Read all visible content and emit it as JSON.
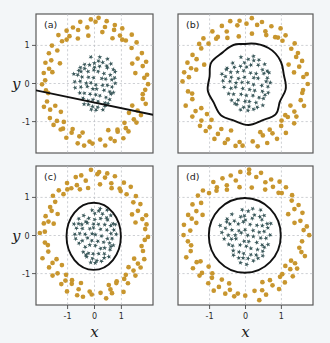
{
  "figure": {
    "background_color": "#f3f6f8",
    "panel_background": "#ffffff",
    "frame_color": "#5a5a5a",
    "grid_color": "#b9bcc2",
    "boundary_color": "#111111"
  },
  "axes": {
    "x_label": "x",
    "y_label": "y",
    "x_ticks": [
      "-1",
      "0",
      "1"
    ],
    "y_ticks": [
      "1",
      "0",
      "-1"
    ],
    "x_tick_values": [
      -1,
      0,
      1
    ],
    "y_tick_values": [
      1,
      0,
      -1
    ],
    "xlim": [
      -1.85,
      1.85
    ],
    "ylim": [
      -1.85,
      1.85
    ]
  },
  "chart_data": {
    "type": "scatter",
    "title": "",
    "subtitle": "",
    "xlabel": "x",
    "ylabel": "y",
    "xlim": [
      -1.85,
      1.85
    ],
    "ylim": [
      -1.85,
      1.85
    ],
    "grid": true,
    "legend_position": "none",
    "annotations": [
      "(a)",
      "(b)",
      "(c)",
      "(d)"
    ],
    "classes": [
      {
        "name": "inner-class",
        "marker": "star",
        "color": "#3c5a5c",
        "description": "Dense cluster of star markers near the origin, radius approximately 0 to 0.8"
      },
      {
        "name": "outer-class",
        "marker": "circle",
        "color": "#c8962e",
        "description": "Ring of circular markers at radius approximately 1.2 to 1.8 around the origin"
      }
    ],
    "panels": [
      {
        "tag": "(a)",
        "boundary_type": "line",
        "boundary_description": "Straight line decision boundary sloping down to the right",
        "boundary_points": [
          [
            -1.85,
            -0.18
          ],
          [
            1.85,
            -0.82
          ]
        ]
      },
      {
        "tag": "(b)",
        "boundary_type": "closed-wiggly-curve",
        "boundary_description": "Irregular wiggly closed curve tightly wrapping the inner star cluster",
        "boundary_radius_mean": 0.95
      },
      {
        "tag": "(c)",
        "boundary_type": "circle",
        "boundary_description": "Smooth circular decision boundary centred near the origin",
        "boundary_center": [
          -0.03,
          -0.02
        ],
        "boundary_radius": 0.88
      },
      {
        "tag": "(d)",
        "boundary_type": "circle",
        "boundary_description": "Smooth circular decision boundary centred near the origin, slightly larger",
        "boundary_center": [
          -0.02,
          -0.03
        ],
        "boundary_radius": 0.97
      }
    ],
    "inner_points": [
      [
        -0.02,
        0.55
      ],
      [
        0.1,
        0.62
      ],
      [
        0.26,
        0.58
      ],
      [
        0.38,
        0.5
      ],
      [
        -0.15,
        0.48
      ],
      [
        0.02,
        0.44
      ],
      [
        0.18,
        0.46
      ],
      [
        0.44,
        0.4
      ],
      [
        0.58,
        0.34
      ],
      [
        -0.3,
        0.4
      ],
      [
        -0.42,
        0.32
      ],
      [
        -0.22,
        0.3
      ],
      [
        -0.05,
        0.34
      ],
      [
        0.12,
        0.3
      ],
      [
        0.3,
        0.28
      ],
      [
        0.48,
        0.24
      ],
      [
        0.62,
        0.18
      ],
      [
        -0.55,
        0.2
      ],
      [
        -0.38,
        0.18
      ],
      [
        -0.18,
        0.16
      ],
      [
        0.0,
        0.18
      ],
      [
        0.2,
        0.14
      ],
      [
        0.36,
        0.12
      ],
      [
        0.54,
        0.08
      ],
      [
        0.68,
        0.02
      ],
      [
        -0.62,
        0.06
      ],
      [
        -0.45,
        0.04
      ],
      [
        -0.28,
        0.02
      ],
      [
        -0.1,
        0.04
      ],
      [
        0.06,
        0.0
      ],
      [
        0.24,
        -0.02
      ],
      [
        0.42,
        -0.06
      ],
      [
        0.58,
        -0.1
      ],
      [
        -0.58,
        -0.08
      ],
      [
        -0.4,
        -0.12
      ],
      [
        -0.24,
        -0.1
      ],
      [
        -0.06,
        -0.14
      ],
      [
        0.1,
        -0.16
      ],
      [
        0.28,
        -0.18
      ],
      [
        0.46,
        -0.22
      ],
      [
        0.6,
        -0.26
      ],
      [
        -0.48,
        -0.24
      ],
      [
        -0.32,
        -0.28
      ],
      [
        -0.14,
        -0.26
      ],
      [
        0.02,
        -0.3
      ],
      [
        0.18,
        -0.32
      ],
      [
        0.34,
        -0.36
      ],
      [
        0.5,
        -0.4
      ],
      [
        -0.36,
        -0.42
      ],
      [
        -0.2,
        -0.44
      ],
      [
        -0.04,
        -0.46
      ],
      [
        0.14,
        -0.48
      ],
      [
        0.3,
        -0.52
      ],
      [
        0.44,
        -0.56
      ],
      [
        -0.22,
        -0.58
      ],
      [
        -0.06,
        -0.62
      ],
      [
        0.1,
        -0.64
      ],
      [
        0.24,
        -0.68
      ],
      [
        -0.12,
        -0.72
      ],
      [
        0.04,
        -0.74
      ],
      [
        0.4,
        0.66
      ],
      [
        0.54,
        0.52
      ],
      [
        -0.34,
        0.54
      ],
      [
        -0.48,
        0.44
      ],
      [
        0.66,
        0.3
      ],
      [
        -0.66,
        0.28
      ],
      [
        0.2,
        0.7
      ],
      [
        -0.1,
        0.68
      ],
      [
        0.32,
        -0.62
      ],
      [
        -0.3,
        -0.54
      ],
      [
        0.52,
        -0.3
      ],
      [
        -0.52,
        0.34
      ]
    ],
    "outer_points": [
      [
        0.05,
        1.62
      ],
      [
        0.3,
        1.52
      ],
      [
        -0.25,
        1.5
      ],
      [
        0.58,
        1.4
      ],
      [
        -0.52,
        1.38
      ],
      [
        0.8,
        1.28
      ],
      [
        -0.78,
        1.26
      ],
      [
        1.02,
        1.12
      ],
      [
        -1.0,
        1.1
      ],
      [
        1.22,
        0.92
      ],
      [
        -1.2,
        0.9
      ],
      [
        1.38,
        0.68
      ],
      [
        -1.36,
        0.66
      ],
      [
        1.5,
        0.42
      ],
      [
        -1.48,
        0.4
      ],
      [
        1.58,
        0.14
      ],
      [
        -1.56,
        0.12
      ],
      [
        1.58,
        -0.16
      ],
      [
        -1.56,
        -0.18
      ],
      [
        1.5,
        -0.44
      ],
      [
        -1.48,
        -0.46
      ],
      [
        1.38,
        -0.7
      ],
      [
        -1.36,
        -0.72
      ],
      [
        1.2,
        -0.94
      ],
      [
        -1.18,
        -0.96
      ],
      [
        0.98,
        -1.14
      ],
      [
        -0.96,
        -1.16
      ],
      [
        0.74,
        -1.3
      ],
      [
        -0.72,
        -1.32
      ],
      [
        0.48,
        -1.42
      ],
      [
        -0.46,
        -1.44
      ],
      [
        0.2,
        -1.52
      ],
      [
        -0.18,
        -1.54
      ],
      [
        -0.05,
        -1.62
      ],
      [
        0.42,
        1.66
      ],
      [
        -0.4,
        1.64
      ],
      [
        0.92,
        1.44
      ],
      [
        -0.9,
        1.42
      ],
      [
        1.32,
        1.06
      ],
      [
        -1.3,
        1.04
      ],
      [
        1.6,
        0.58
      ],
      [
        -1.58,
        0.56
      ],
      [
        1.7,
        0.0
      ],
      [
        -1.68,
        0.02
      ],
      [
        1.62,
        -0.58
      ],
      [
        -1.6,
        -0.6
      ],
      [
        1.3,
        -1.08
      ],
      [
        -1.28,
        -1.1
      ],
      [
        0.88,
        -1.46
      ],
      [
        -0.86,
        -1.48
      ],
      [
        0.34,
        -1.68
      ],
      [
        -0.32,
        -1.66
      ],
      [
        0.66,
        1.54
      ],
      [
        -0.64,
        1.52
      ],
      [
        1.14,
        1.26
      ],
      [
        -1.12,
        1.24
      ],
      [
        1.46,
        0.82
      ],
      [
        -1.44,
        0.8
      ],
      [
        1.66,
        0.28
      ],
      [
        -1.64,
        0.3
      ],
      [
        1.44,
        -0.86
      ],
      [
        -1.42,
        -0.88
      ],
      [
        1.06,
        -1.28
      ],
      [
        -1.04,
        -1.26
      ],
      [
        0.6,
        -1.56
      ],
      [
        -0.58,
        -1.58
      ],
      [
        0.14,
        1.72
      ],
      [
        -0.12,
        1.7
      ],
      [
        1.24,
        -0.62
      ],
      [
        -1.22,
        -0.64
      ],
      [
        0.86,
        1.18
      ],
      [
        -0.84,
        1.2
      ],
      [
        1.52,
        -0.28
      ],
      [
        -1.5,
        -0.3
      ],
      [
        0.7,
        -1.18
      ],
      [
        -0.68,
        -1.2
      ],
      [
        0.22,
        1.32
      ],
      [
        -0.2,
        1.3
      ],
      [
        1.16,
        0.52
      ],
      [
        -1.14,
        0.54
      ],
      [
        0.96,
        -1.02
      ],
      [
        -0.94,
        -1.0
      ],
      [
        0.44,
        -1.28
      ],
      [
        -0.42,
        -1.26
      ],
      [
        1.34,
        0.3
      ],
      [
        -1.32,
        0.32
      ],
      [
        0.52,
        1.24
      ],
      [
        -0.5,
        1.22
      ],
      [
        1.08,
        -0.8
      ],
      [
        -1.06,
        -0.78
      ]
    ]
  },
  "panel_labels": {
    "a": "(a)",
    "b": "(b)",
    "c": "(c)",
    "d": "(d)"
  }
}
